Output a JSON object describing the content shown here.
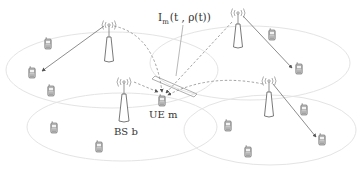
{
  "diagram": {
    "type": "cellular-network-interference",
    "labels": {
      "interference": "I",
      "interference_sub": "m",
      "interference_args": "(t , ρ(t))",
      "ue": "UE m",
      "bs": "BS b"
    },
    "colors": {
      "cell_outline": "#e4e4e4",
      "link": "#707070",
      "interference_link": "#8a8a8a",
      "phone": "#c8c8c8"
    },
    "base_stations": [
      {
        "id": "bs-top-left",
        "label": ""
      },
      {
        "id": "bs-top-right",
        "label": ""
      },
      {
        "id": "bs-b",
        "label": "BS b"
      },
      {
        "id": "bs-bottom-right",
        "label": ""
      }
    ],
    "cells": 4,
    "user_equipment_count": 12,
    "links": [
      {
        "from": "bs-top-left",
        "to": "phone",
        "style": "solid"
      },
      {
        "from": "bs-top-right",
        "to": "phone",
        "style": "solid"
      },
      {
        "from": "bs-bottom-right",
        "to": "phone",
        "style": "solid"
      },
      {
        "from": "bs-b",
        "to": "ue-m",
        "style": "dashed-arrow"
      },
      {
        "from": "bs-top-left",
        "to": "ue-m",
        "style": "dashed-interference"
      },
      {
        "from": "bs-top-right",
        "to": "ue-m",
        "style": "dashed-interference"
      },
      {
        "from": "bs-bottom-right",
        "to": "ue-m",
        "style": "dashed-interference"
      }
    ]
  }
}
